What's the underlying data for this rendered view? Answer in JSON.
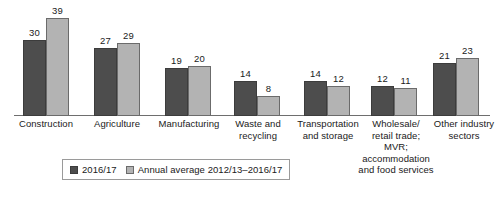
{
  "chart_data": {
    "type": "bar",
    "title": "",
    "subtitle": "",
    "xlabel": "",
    "ylabel": "",
    "ylim": [
      0,
      40
    ],
    "grid": false,
    "legend_position": "bottom-left",
    "axis": {
      "baseline_visible": true,
      "y_axis_visible": false,
      "tick_labels": []
    },
    "categories": [
      "Construction",
      "Agriculture",
      "Manufacturing",
      "Waste and recycling",
      "Transportation and storage",
      "Wholesale/ retail trade; MVR; accommodation and food services",
      "Other industry sectors"
    ],
    "category_label_lines": [
      [
        "Construction"
      ],
      [
        "Agriculture"
      ],
      [
        "Manufacturing"
      ],
      [
        "Waste and",
        "recycling"
      ],
      [
        "Transportation",
        "and storage"
      ],
      [
        "Wholesale/",
        "retail trade;",
        "MVR;",
        "accommodation",
        "and food services"
      ],
      [
        "Other industry",
        "sectors"
      ]
    ],
    "series": [
      {
        "name": "2016/17",
        "color": "#4d4d4d",
        "values": [
          30,
          27,
          19,
          14,
          14,
          12,
          21
        ]
      },
      {
        "name": "Annual average 2012/13–2016/17",
        "color": "#b3b3b3",
        "values": [
          39,
          29,
          20,
          8,
          12,
          11,
          23
        ]
      }
    ]
  },
  "legend": {
    "items": [
      {
        "label": "2016/17",
        "swatch": "series-0"
      },
      {
        "label": "Annual average 2012/13–2016/17",
        "swatch": "series-1"
      }
    ]
  }
}
